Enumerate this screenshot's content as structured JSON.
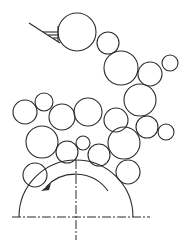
{
  "diagram": {
    "type": "particle-flow-schematic",
    "colors": {
      "stroke": "#2b2b2b",
      "background": "#ffffff"
    },
    "support": {
      "anchor": [
        58,
        32
      ],
      "line_start": [
        29,
        23
      ],
      "line_end": [
        60,
        43
      ]
    },
    "particles": [
      {
        "cx": 77,
        "cy": 32,
        "r": 19
      },
      {
        "cx": 108,
        "cy": 43,
        "r": 11
      },
      {
        "cx": 121,
        "cy": 68,
        "r": 17
      },
      {
        "cx": 150,
        "cy": 74,
        "r": 12
      },
      {
        "cx": 170,
        "cy": 63,
        "r": 8
      },
      {
        "cx": 140,
        "cy": 100,
        "r": 16
      },
      {
        "cx": 25,
        "cy": 112,
        "r": 12
      },
      {
        "cx": 44,
        "cy": 102,
        "r": 9
      },
      {
        "cx": 62,
        "cy": 117,
        "r": 13
      },
      {
        "cx": 88,
        "cy": 112,
        "r": 14
      },
      {
        "cx": 116,
        "cy": 120,
        "r": 12
      },
      {
        "cx": 147,
        "cy": 127,
        "r": 11
      },
      {
        "cx": 166,
        "cy": 132,
        "r": 8
      },
      {
        "cx": 42,
        "cy": 142,
        "r": 16
      },
      {
        "cx": 124,
        "cy": 143,
        "r": 16
      },
      {
        "cx": 67,
        "cy": 152,
        "r": 11
      },
      {
        "cx": 83,
        "cy": 143,
        "r": 7
      },
      {
        "cx": 99,
        "cy": 155,
        "r": 11
      },
      {
        "cx": 128,
        "cy": 172,
        "r": 12
      },
      {
        "cx": 35,
        "cy": 175,
        "r": 12
      }
    ],
    "drum": {
      "cx": 76,
      "cy": 217,
      "r": 57,
      "rotation": "counter-clockwise"
    },
    "axes": {
      "horizontal": {
        "y": 217,
        "x1": 12,
        "x2": 150
      },
      "vertical": {
        "x": 76,
        "y1": 160,
        "y2": 240
      }
    }
  }
}
